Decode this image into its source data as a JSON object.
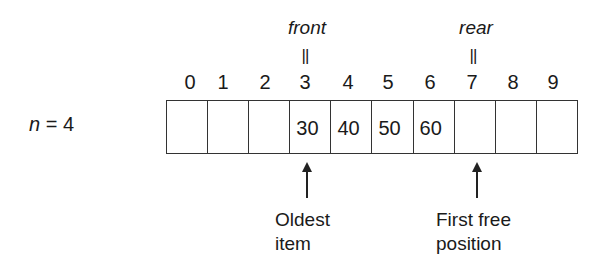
{
  "diagram": {
    "count_label": {
      "variable": "n",
      "equals": " = ",
      "value": "4"
    },
    "pointers": {
      "front": {
        "name": "front",
        "equals_mark": "||",
        "index": 3
      },
      "rear": {
        "name": "rear",
        "equals_mark": "||",
        "index": 7
      }
    },
    "indices": [
      "0",
      "1",
      "2",
      "3",
      "4",
      "5",
      "6",
      "7",
      "8",
      "9"
    ],
    "cells": [
      "",
      "",
      "",
      "30",
      "40",
      "50",
      "60",
      "",
      "",
      ""
    ],
    "annotations": {
      "front_caption": [
        "Oldest",
        "item"
      ],
      "rear_caption": [
        "First free",
        "position"
      ]
    }
  }
}
